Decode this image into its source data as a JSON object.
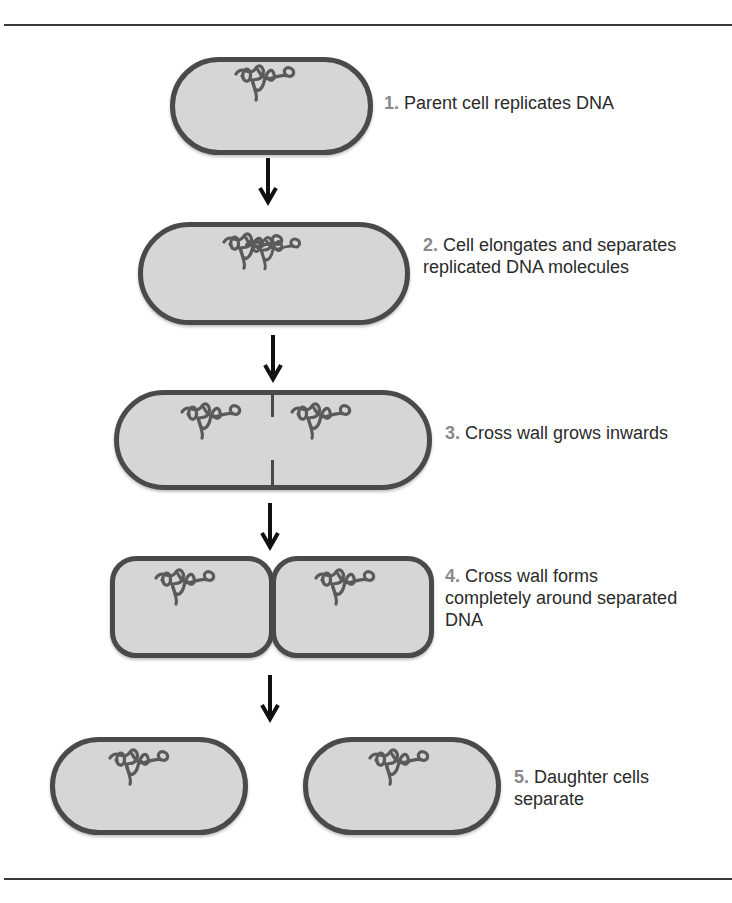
{
  "diagram": {
    "colors": {
      "cell_fill": "#d6d6d6",
      "cell_border": "#4a4a4a",
      "dna": "#5a5a5a",
      "step_number": "#8a8a8a",
      "text": "#2a2a2a",
      "arrow": "#111111",
      "rule": "#3a3a3a"
    },
    "steps": [
      {
        "number": "1.",
        "text": "Parent cell replicates DNA"
      },
      {
        "number": "2.",
        "text": "Cell elongates and separates replicated DNA molecules"
      },
      {
        "number": "3.",
        "text": "Cross wall grows inwards"
      },
      {
        "number": "4.",
        "text": "Cross wall forms completely around separated DNA"
      },
      {
        "number": "5.",
        "text": "Daughter cells separate"
      }
    ],
    "arrows": [
      "down-arrow",
      "down-arrow",
      "down-arrow",
      "down-arrow"
    ]
  }
}
